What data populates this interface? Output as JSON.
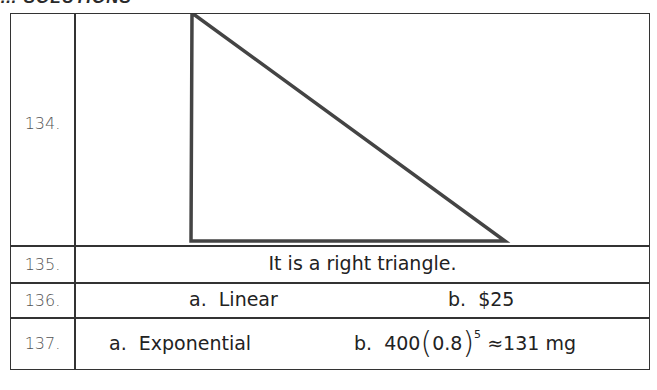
{
  "heading": "… SOLUTIONS",
  "rows": [
    {
      "number": "134.",
      "content_type": "figure",
      "figure": "right-triangle"
    },
    {
      "number": "135.",
      "text": "It is a right triangle."
    },
    {
      "number": "136.",
      "part_a": "a.  Linear",
      "part_b": "b.  $25"
    },
    {
      "number": "137.",
      "part_a": "a.  Exponential",
      "part_b_prefix": "b.  400",
      "base": "0.8",
      "exponent": "5",
      "result": "≈131 mg"
    }
  ]
}
